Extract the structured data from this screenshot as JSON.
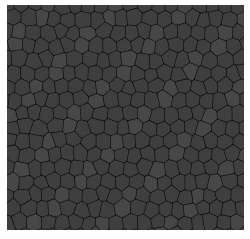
{
  "image": {
    "description": "Voronoi cellular texture",
    "background_color": "#ffffff",
    "border_color": "#080808",
    "cell_color": "#3f3f3f",
    "cell_highlight": "#474747"
  },
  "panel": {
    "x": 7,
    "y": 5,
    "width": 237,
    "height": 225
  },
  "cells": {
    "cols": 18,
    "rows": 17,
    "pitch_x": 13.6,
    "pitch_y": 13.6,
    "seed": 7
  }
}
